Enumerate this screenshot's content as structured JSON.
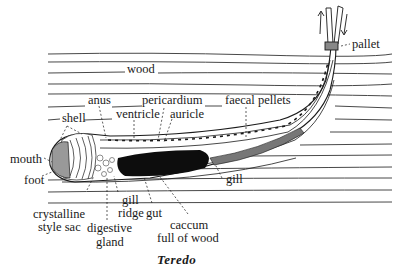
{
  "figure": {
    "caption": "Teredo",
    "colors": {
      "ink": "#1a1a1a",
      "background": "#ffffff",
      "gut": "#0d0d0d"
    }
  },
  "labels": {
    "wood": "wood",
    "pallet": "pallet",
    "anus": "anus",
    "pericardium": "pericardium",
    "faecal_pellets": "faecal pellets",
    "shell": "shell",
    "ventricle": "ventricle",
    "auricle": "auricle",
    "mouth": "mouth",
    "foot": "foot",
    "gill_right": "gill",
    "crystalline_style_sac_1": "crystalline",
    "crystalline_style_sac_2": "style sac",
    "digestive_gland_1": "digestive",
    "digestive_gland_2": "gland",
    "gill_ridge_1": "gill",
    "gill_ridge_2": "ridge",
    "gut": "gut",
    "caecum_1": "caccum",
    "caecum_2": "full of wood"
  }
}
